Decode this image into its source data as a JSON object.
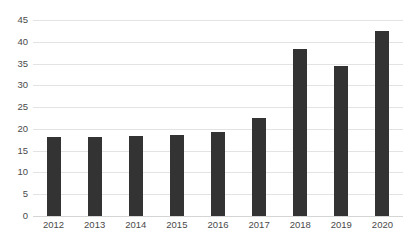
{
  "chart_data": {
    "type": "bar",
    "title": "",
    "subtitle": "",
    "xlabel": "",
    "ylabel": "",
    "categories": [
      "2012",
      "2013",
      "2014",
      "2015",
      "2016",
      "2017",
      "2018",
      "2019",
      "2020"
    ],
    "values": [
      18.2,
      18.2,
      18.4,
      18.5,
      19.4,
      22.4,
      38.3,
      34.4,
      42.4
    ],
    "series": [
      {
        "name": "",
        "values": [
          18.2,
          18.2,
          18.4,
          18.5,
          19.4,
          22.4,
          38.3,
          34.4,
          42.4
        ]
      }
    ],
    "ylim": [
      0,
      45
    ],
    "ytick_step": 5,
    "ytick_labels": [
      "0",
      "5",
      "10",
      "15",
      "20",
      "25",
      "30",
      "35",
      "40",
      "45"
    ],
    "ytick_values": [
      0,
      5,
      10,
      15,
      20,
      25,
      30,
      35,
      40,
      45
    ],
    "xtick_labels": [
      "2012",
      "2013",
      "2014",
      "2015",
      "2016",
      "2017",
      "2018",
      "2019",
      "2020"
    ],
    "grid": true,
    "grid_axis": "y",
    "legend": false,
    "legend_position": "none",
    "annotations": [],
    "data_labels": false,
    "bar_color": "#333333",
    "gridline_color": "#E3E3E3",
    "axis_text_color": "#4A4A4A",
    "background_color": "#FFFFFF"
  }
}
